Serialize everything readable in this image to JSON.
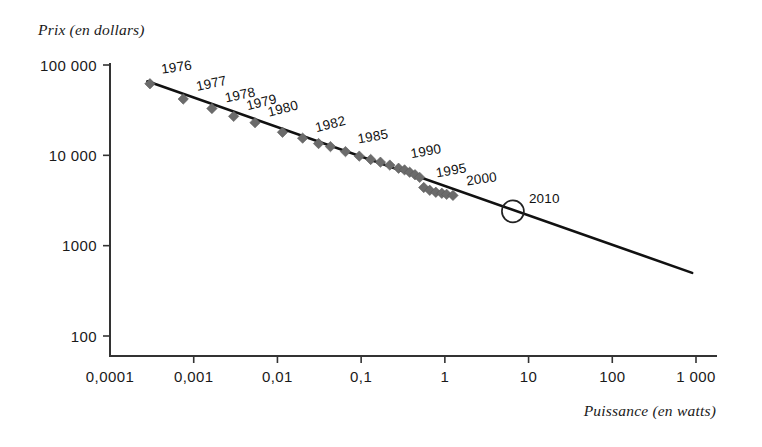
{
  "chart_data": {
    "type": "scatter",
    "title": "",
    "xlabel": "Puissance (en watts)",
    "ylabel": "Prix (en dollars)",
    "x_scale": "log",
    "y_scale": "log",
    "xlim": [
      0.0001,
      1000
    ],
    "ylim": [
      100,
      100000
    ],
    "grid": false,
    "legend": null,
    "x_tick_labels": [
      "0,0001",
      "0,001",
      "0,01",
      "0,1",
      "1",
      "10",
      "100",
      "1 000"
    ],
    "x_tick_values": [
      0.0001,
      0.001,
      0.01,
      0.1,
      1,
      10,
      100,
      1000
    ],
    "y_tick_labels": [
      "100 000",
      "10 000",
      "1000",
      "100"
    ],
    "y_tick_values": [
      100000,
      10000,
      1000,
      100
    ],
    "series": [
      {
        "name": "Prix par watt (historique)",
        "marker": "diamond",
        "color": "#6b6b6b",
        "points": [
          {
            "x": 0.0003,
            "y": 62000,
            "year": "1976"
          },
          {
            "x": 0.00075,
            "y": 42000,
            "year": "1977"
          },
          {
            "x": 0.00165,
            "y": 33000,
            "year": "1978"
          },
          {
            "x": 0.003,
            "y": 27000,
            "year": "1979"
          },
          {
            "x": 0.0054,
            "y": 23000,
            "year": "1980"
          },
          {
            "x": 0.0115,
            "y": 18000,
            "year": "1981"
          },
          {
            "x": 0.02,
            "y": 15500,
            "year": "1982"
          },
          {
            "x": 0.031,
            "y": 13500,
            "year": "1983"
          },
          {
            "x": 0.043,
            "y": 12500,
            "year": "1984"
          },
          {
            "x": 0.065,
            "y": 11000,
            "year": "1985"
          },
          {
            "x": 0.095,
            "y": 9800,
            "year": "1986"
          },
          {
            "x": 0.13,
            "y": 9000,
            "year": "1987"
          },
          {
            "x": 0.17,
            "y": 8400,
            "year": "1988"
          },
          {
            "x": 0.22,
            "y": 7800,
            "year": "1989"
          },
          {
            "x": 0.28,
            "y": 7200,
            "year": "1990"
          },
          {
            "x": 0.33,
            "y": 6900,
            "year": "1991"
          },
          {
            "x": 0.38,
            "y": 6500,
            "year": "1992"
          },
          {
            "x": 0.44,
            "y": 6100,
            "year": "1993"
          },
          {
            "x": 0.5,
            "y": 5700,
            "year": "1994"
          },
          {
            "x": 0.56,
            "y": 4400,
            "year": "1995"
          },
          {
            "x": 0.66,
            "y": 4100,
            "year": "1996"
          },
          {
            "x": 0.78,
            "y": 3900,
            "year": "1997"
          },
          {
            "x": 0.92,
            "y": 3800,
            "year": "1998"
          },
          {
            "x": 1.05,
            "y": 3700,
            "year": "1999"
          },
          {
            "x": 1.25,
            "y": 3600,
            "year": "2000"
          }
        ]
      },
      {
        "name": "Projection",
        "marker": "circle-open",
        "color": "#222222",
        "points": [
          {
            "x": 6.5,
            "y": 2400,
            "year": "2010"
          }
        ]
      }
    ],
    "trend_line": {
      "name": "Tendance log-log",
      "x_start": 0.00028,
      "y_start": 66000,
      "x_end": 900,
      "y_end": 500
    },
    "annotations": [
      {
        "text": "1976",
        "x": 0.0003,
        "y": 62000
      },
      {
        "text": "1977",
        "x": 0.00075,
        "y": 42000
      },
      {
        "text": "1978",
        "x": 0.00165,
        "y": 33000
      },
      {
        "text": "1979",
        "x": 0.003,
        "y": 27000
      },
      {
        "text": "1980",
        "x": 0.0054,
        "y": 23000
      },
      {
        "text": "1982",
        "x": 0.02,
        "y": 15500
      },
      {
        "text": "1985",
        "x": 0.065,
        "y": 11000
      },
      {
        "text": "1990",
        "x": 0.28,
        "y": 7200
      },
      {
        "text": "1995",
        "x": 0.56,
        "y": 4400
      },
      {
        "text": "2000",
        "x": 1.25,
        "y": 3600
      },
      {
        "text": "2010",
        "x": 6.5,
        "y": 2400
      }
    ]
  },
  "axes": {
    "y_title": "Prix (en dollars)",
    "x_title": "Puissance (en watts)",
    "y_ticks": [
      {
        "label": "100 000"
      },
      {
        "label": "10 000"
      },
      {
        "label": "1000"
      },
      {
        "label": "100"
      }
    ],
    "x_ticks": [
      {
        "label": "0,0001"
      },
      {
        "label": "0,001"
      },
      {
        "label": "0,01"
      },
      {
        "label": "0,1"
      },
      {
        "label": "1"
      },
      {
        "label": "10"
      },
      {
        "label": "100"
      },
      {
        "label": "1 000"
      }
    ]
  },
  "year_labels": [
    {
      "text": "1976"
    },
    {
      "text": "1977"
    },
    {
      "text": "1978"
    },
    {
      "text": "1979"
    },
    {
      "text": "1980"
    },
    {
      "text": "1982"
    },
    {
      "text": "1985"
    },
    {
      "text": "1990"
    },
    {
      "text": "1995"
    },
    {
      "text": "2000"
    },
    {
      "text": "2010"
    }
  ],
  "colors": {
    "marker": "#6b6b6b",
    "line": "#111111",
    "axis": "#333333",
    "text": "#1a1a1a",
    "background": "#ffffff"
  }
}
